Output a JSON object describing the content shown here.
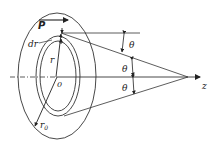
{
  "diagram": {
    "labels": {
      "vector_p": "P",
      "ring_width": "dr",
      "radius": "r",
      "center": "0",
      "outer_radius": "r",
      "outer_radius_sub": "0",
      "theta_top": "θ",
      "theta_mid": "θ",
      "theta_bot": "θ",
      "axis": "z"
    },
    "colors": {
      "stroke": "#333333",
      "text": "#222222",
      "background": "#ffffff"
    }
  }
}
